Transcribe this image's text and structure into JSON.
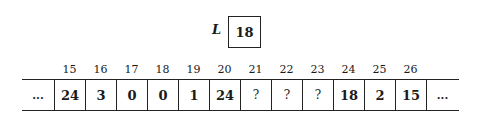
{
  "variable": {
    "name": "L",
    "value": "18"
  },
  "array": {
    "left_ellipsis": "...",
    "right_ellipsis": "...",
    "indices": [
      "15",
      "16",
      "17",
      "18",
      "19",
      "20",
      "21",
      "22",
      "23",
      "24",
      "25",
      "26"
    ],
    "values": [
      "24",
      "3",
      "0",
      "0",
      "1",
      "24",
      "?",
      "?",
      "?",
      "18",
      "2",
      "15"
    ]
  }
}
